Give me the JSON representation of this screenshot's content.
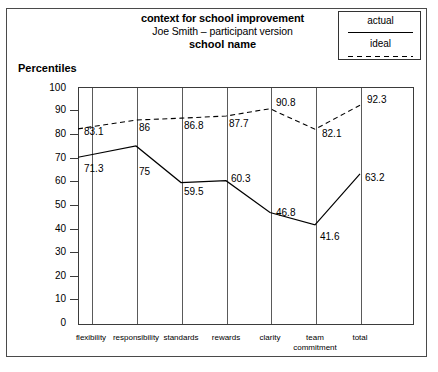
{
  "header": {
    "title_line1": "context for school improvement",
    "title_line2": "Joe Smith – participant version",
    "title_line3": "school name"
  },
  "legend": {
    "position": "top-right",
    "entries": [
      {
        "label": "actual",
        "style": "solid",
        "icon": "solid-line-icon"
      },
      {
        "label": "ideal",
        "style": "dashed",
        "icon": "dashed-line-icon"
      }
    ]
  },
  "axis": {
    "y_title": "Percentiles",
    "y_ticks": [
      "100",
      "90",
      "80",
      "70",
      "60",
      "50",
      "40",
      "30",
      "20",
      "10",
      "0"
    ],
    "x_labels": [
      {
        "line1": "flexibility",
        "line2": ""
      },
      {
        "line1": "responsibility",
        "line2": ""
      },
      {
        "line1": "standards",
        "line2": ""
      },
      {
        "line1": "rewards",
        "line2": ""
      },
      {
        "line1": "clarity",
        "line2": ""
      },
      {
        "line1": "team",
        "line2": "commitment"
      },
      {
        "line1": "total",
        "line2": ""
      }
    ]
  },
  "chart_data": {
    "type": "line",
    "title": "context for school improvement",
    "subtitle": "Joe Smith – participant version",
    "subtitle2": "school name",
    "xlabel": "",
    "ylabel": "Percentiles",
    "ylim": [
      0,
      100
    ],
    "ytick_step": 10,
    "grid": "vertical",
    "legend_position": "top-right",
    "categories": [
      "flexibility",
      "responsibility",
      "standards",
      "rewards",
      "clarity",
      "team commitment",
      "total"
    ],
    "series": [
      {
        "name": "actual",
        "style": "solid",
        "values": [
          71.3,
          75,
          59.5,
          60.3,
          46.8,
          41.6,
          63.2
        ],
        "labels": [
          "71.3",
          "75",
          "59.5",
          "60.3",
          "46.8",
          "41.6",
          "63.2"
        ]
      },
      {
        "name": "ideal",
        "style": "dashed",
        "values": [
          83.1,
          86,
          86.8,
          87.7,
          90.8,
          82.1,
          92.3
        ],
        "labels": [
          "83.1",
          "86",
          "86.8",
          "87.7",
          "90.8",
          "82.1",
          "92.3"
        ]
      }
    ]
  }
}
